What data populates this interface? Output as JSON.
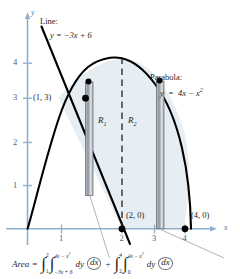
{
  "figure": {
    "title_kind": "calculus-region-double-integral-diagram",
    "axes": {
      "x_label": "x",
      "y_label": "y",
      "x_ticks": [
        "1",
        "2",
        "3",
        "4"
      ],
      "y_ticks": [
        "1",
        "2",
        "3",
        "4"
      ],
      "x_range": [
        -0.3,
        4.9
      ],
      "y_range": [
        -0.55,
        4.75
      ],
      "axis_color": "#8fb0cc"
    },
    "curves": [
      {
        "name": "parabola",
        "label_title": "Parabola:",
        "label_equation": "y = 4x − x²",
        "equation_lhs": "y",
        "equation_rhs_a": "4x − x",
        "equation_exp": "2",
        "type": "quadratic",
        "roots": [
          0,
          4
        ],
        "vertex": [
          2,
          4
        ],
        "color": "#000000"
      },
      {
        "name": "line",
        "label_title": "Line:",
        "label_equation": "y = −3x + 6",
        "equation_lhs": "y",
        "equation_rhs": "= −3x + 6",
        "slope": -3,
        "intercept": 6,
        "color": "#000000"
      }
    ],
    "points": [
      {
        "name": "intersection",
        "label": "(1, 3)",
        "x": 1,
        "y": 3
      },
      {
        "name": "x-intercept-line",
        "label": "(2, 0)",
        "x": 2,
        "y": 0
      },
      {
        "name": "x-intercept-parabola",
        "label": "(4, 0)",
        "x": 4,
        "y": 0
      }
    ],
    "regions": [
      {
        "name": "R1",
        "label": "R",
        "sub": "1"
      },
      {
        "name": "R2",
        "label": "R",
        "sub": "2"
      }
    ],
    "divider": {
      "name": "vertical-dashed-line-at-x-2",
      "x": 2,
      "style": "dashed"
    },
    "strips": [
      {
        "name": "representative-strip-R1",
        "x": 1.35
      },
      {
        "name": "representative-strip-R2",
        "x": 3.15
      }
    ],
    "shaded_fill": "#e7eef3"
  },
  "formula": {
    "area_label": "Area",
    "equals": "=",
    "plus": "+",
    "term1": {
      "outer_upper": "2",
      "outer_lower": "1",
      "inner_upper_a": "4x − x",
      "inner_upper_exp": "2",
      "inner_lower": "−3x + 6",
      "differentials": "dy",
      "circled": "dx"
    },
    "term2": {
      "outer_upper": "4",
      "outer_lower": "2",
      "inner_upper_a": "4x − x",
      "inner_upper_exp": "2",
      "inner_lower": "0",
      "differentials": "dy",
      "circled": "dx"
    }
  }
}
